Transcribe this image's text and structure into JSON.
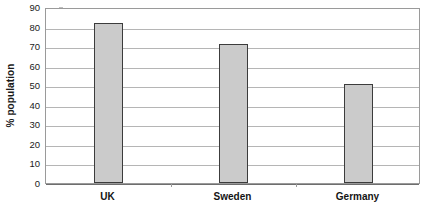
{
  "chart_data": {
    "type": "bar",
    "title": "",
    "subtitle": "",
    "xlabel": "",
    "ylabel": "% population",
    "categories": [
      "UK",
      "Sweden",
      "Germany"
    ],
    "values": [
      82,
      71,
      50.5
    ],
    "ylim": [
      0,
      90
    ],
    "ytick_step": 10,
    "yticks": [
      0,
      10,
      20,
      30,
      40,
      50,
      60,
      70,
      80,
      90
    ],
    "ytick_labels": [
      "0",
      "10",
      "20",
      "30",
      "40",
      "50",
      "60",
      "70",
      "80",
      "90"
    ],
    "grid": true,
    "grid_axis": "y",
    "legend": false,
    "legend_position": "none",
    "series": [
      {
        "name": "% population",
        "values": [
          82,
          71,
          50.5
        ]
      }
    ],
    "annotations": []
  },
  "style": {
    "bar_fill": "#cbcbcb",
    "bar_border": "#3c3c3c",
    "gridline_color": "#b5b5b5",
    "axis_color": "#9a9a9a",
    "baseline_color": "#6e6e6e",
    "text_color": "#1a1a1a",
    "background": "#ffffff"
  }
}
